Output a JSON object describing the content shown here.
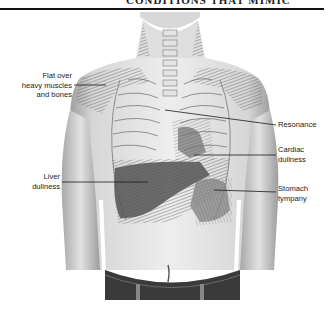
{
  "header": {
    "running_title": "CONDITIONS THAT MIMIC"
  },
  "figure": {
    "colors": {
      "skin_light": "#e8e8e8",
      "skin_mid": "#c9c9c9",
      "skin_shadow": "#8f8f8f",
      "hatch": "#555555",
      "dull_region": "#5a5a5a",
      "leader_line": "#1a1a1a",
      "jeans": "#3a3a3a"
    }
  },
  "labels": [
    {
      "id": "flat",
      "lines": [
        "Flat over",
        "heavy muscles",
        "and bones"
      ],
      "side": "left"
    },
    {
      "id": "resonance",
      "lines": [
        "Resonance"
      ],
      "side": "right"
    },
    {
      "id": "cardiac",
      "lines": [
        "Cardiac",
        "dullness"
      ],
      "side": "right"
    },
    {
      "id": "liver",
      "lines": [
        "Liver",
        "dullness"
      ],
      "side": "left"
    },
    {
      "id": "stomach",
      "lines": [
        "Stomach",
        "tympany"
      ],
      "side": "right"
    }
  ]
}
